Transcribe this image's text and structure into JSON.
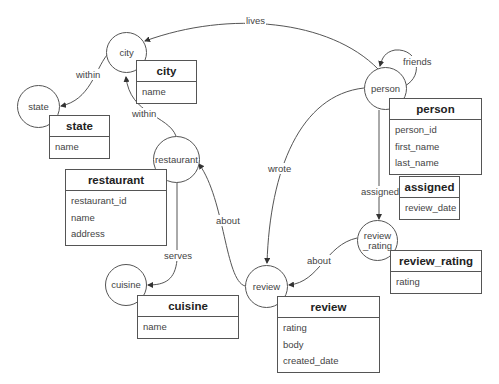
{
  "diagram": {
    "type": "graph-schema",
    "nodes": [
      {
        "id": "city",
        "label": "city"
      },
      {
        "id": "state",
        "label": "state"
      },
      {
        "id": "restaurant",
        "label": "restaurant"
      },
      {
        "id": "cuisine",
        "label": "cuisine"
      },
      {
        "id": "review",
        "label": "review"
      },
      {
        "id": "review_rating",
        "label": "review\n_rating"
      },
      {
        "id": "person",
        "label": "person"
      }
    ],
    "tables": {
      "city": {
        "title": "city",
        "fields": [
          "name"
        ]
      },
      "state": {
        "title": "state",
        "fields": [
          "name"
        ]
      },
      "restaurant": {
        "title": "restaurant",
        "fields": [
          "restaurant_id",
          "name",
          "address"
        ]
      },
      "cuisine": {
        "title": "cuisine",
        "fields": [
          "name"
        ]
      },
      "review": {
        "title": "review",
        "fields": [
          "rating",
          "body",
          "created_date"
        ]
      },
      "review_rating": {
        "title": "review_rating",
        "fields": [
          "rating"
        ]
      },
      "person": {
        "title": "person",
        "fields": [
          "person_id",
          "first_name",
          "last_name"
        ]
      },
      "assigned": {
        "title": "assigned",
        "fields": [
          "review_date"
        ]
      }
    },
    "edges": [
      {
        "from": "person",
        "to": "city",
        "label": "lives"
      },
      {
        "from": "person",
        "to": "person",
        "label": "friends"
      },
      {
        "from": "city",
        "to": "state",
        "label": "within"
      },
      {
        "from": "restaurant",
        "to": "city",
        "label": "within"
      },
      {
        "from": "person",
        "to": "review",
        "label": "wrote"
      },
      {
        "from": "person",
        "to": "review_rating",
        "label": "assigned"
      },
      {
        "from": "review",
        "to": "restaurant",
        "label": "about"
      },
      {
        "from": "restaurant",
        "to": "cuisine",
        "label": "serves"
      },
      {
        "from": "review_rating",
        "to": "review",
        "label": "about"
      }
    ]
  }
}
